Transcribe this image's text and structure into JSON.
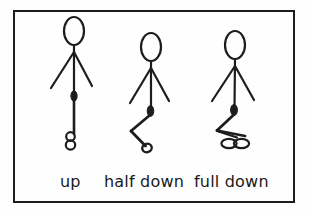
{
  "diagram": {
    "background_color": "#fefefe",
    "stroke_color": "#1d1d1d",
    "frame": {
      "border_color": "#1d1d1d",
      "border_width_px": 2,
      "x": 13,
      "y": 10,
      "width": 282,
      "height": 193
    },
    "figures": [
      {
        "id": "figure-up",
        "label": "up",
        "pose": "standing upright, legs straight together, feet stacked circles",
        "head": {
          "cx": 74,
          "cy": 31,
          "rx": 10,
          "ry": 14
        },
        "neck": {
          "x1": 74,
          "y1": 45,
          "x2": 74,
          "y2": 52
        },
        "arm_left": {
          "x1": 74,
          "y1": 52,
          "x2": 51,
          "y2": 88
        },
        "arm_right": {
          "x1": 74,
          "y1": 52,
          "x2": 92,
          "y2": 86
        },
        "torso": {
          "x1": 74,
          "y1": 49,
          "x2": 74,
          "y2": 95
        },
        "hip_joint": {
          "cx": 74,
          "cy": 95,
          "rx": 3.2,
          "ry": 5
        },
        "thigh": {
          "x1": 74,
          "y1": 95,
          "x2": 74,
          "y2": 133
        },
        "feet": [
          {
            "cx": 71,
            "cy": 136,
            "rx": 4.2,
            "ry": 4.2
          },
          {
            "cx": 71,
            "cy": 144,
            "rx": 4.6,
            "ry": 4.6
          }
        ]
      },
      {
        "id": "figure-half-down",
        "label": "half down",
        "pose": "half squat, leg bent at knee in a zigzag, single foot oval",
        "head": {
          "cx": 151,
          "cy": 47,
          "rx": 10,
          "ry": 14
        },
        "neck": {
          "x1": 151,
          "y1": 61,
          "x2": 151,
          "y2": 68
        },
        "arm_left": {
          "x1": 151,
          "y1": 68,
          "x2": 130,
          "y2": 103
        },
        "arm_right": {
          "x1": 151,
          "y1": 68,
          "x2": 169,
          "y2": 101
        },
        "torso": {
          "x1": 151,
          "y1": 65,
          "x2": 151,
          "y2": 108
        },
        "hip_joint": {
          "cx": 151,
          "cy": 110,
          "rx": 3.2,
          "ry": 5.5
        },
        "thigh": {
          "x1": 150,
          "y1": 114,
          "x2": 131,
          "y2": 131
        },
        "shin": {
          "x1": 131,
          "y1": 131,
          "x2": 146,
          "y2": 146
        },
        "feet": [
          {
            "cx": 147,
            "cy": 148,
            "rx": 4.6,
            "ry": 4.2
          }
        ]
      },
      {
        "id": "figure-full-down",
        "label": "full down",
        "pose": "full deep squat, flat folded leg, two side-by-side foot ovals",
        "head": {
          "cx": 235,
          "cy": 45,
          "rx": 10,
          "ry": 14
        },
        "neck": {
          "x1": 235,
          "y1": 59,
          "x2": 235,
          "y2": 66
        },
        "arm_left": {
          "x1": 235,
          "y1": 66,
          "x2": 212,
          "y2": 101
        },
        "arm_right": {
          "x1": 235,
          "y1": 66,
          "x2": 254,
          "y2": 100
        },
        "torso": {
          "x1": 235,
          "y1": 63,
          "x2": 235,
          "y2": 108
        },
        "hip_joint": {
          "cx": 234,
          "cy": 110,
          "rx": 3.4,
          "ry": 5.5
        },
        "thigh": {
          "x1": 234,
          "y1": 115,
          "x2": 219,
          "y2": 131
        },
        "shin": {
          "x1": 219,
          "y1": 131,
          "x2": 243,
          "y2": 136
        },
        "feet": [
          {
            "cx": 229,
            "cy": 143,
            "rx": 7.5,
            "ry": 4.5
          },
          {
            "cx": 241,
            "cy": 143,
            "rx": 7.5,
            "ry": 4.5
          }
        ]
      }
    ],
    "labels": [
      "up",
      "half down",
      "full down"
    ]
  }
}
